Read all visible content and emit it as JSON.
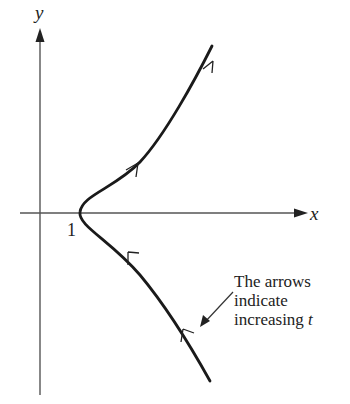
{
  "axes": {
    "x_label": "x",
    "y_label": "y",
    "tick_label_x": "1"
  },
  "annotation": {
    "line1": "The arrows",
    "line2": "indicate",
    "line3_text": "increasing ",
    "line3_var": "t"
  },
  "colors": {
    "curve": "#1a1a1a",
    "axis": "#555555",
    "background": "#ffffff"
  }
}
